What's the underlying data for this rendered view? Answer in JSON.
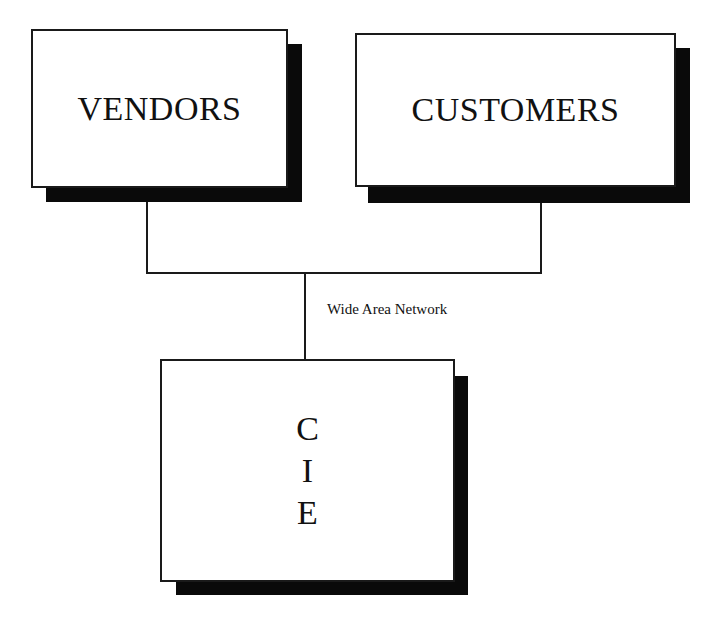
{
  "diagram": {
    "nodes": [
      {
        "id": "vendors",
        "label": "VENDORS"
      },
      {
        "id": "customers",
        "label": "CUSTOMERS"
      },
      {
        "id": "cie",
        "label": "CIE",
        "letters": [
          "C",
          "I",
          "E"
        ]
      }
    ],
    "edges": [
      {
        "from": "vendors",
        "to": "cie",
        "via": "Wide Area Network"
      },
      {
        "from": "customers",
        "to": "cie",
        "via": "Wide Area Network"
      }
    ],
    "connector_label": "Wide Area Network"
  }
}
